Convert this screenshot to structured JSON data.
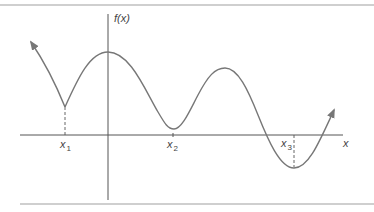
{
  "figure": {
    "y_axis_label": "f(x)",
    "x_axis_label": "x",
    "points": [
      {
        "base": "x",
        "sub": "1"
      },
      {
        "base": "x",
        "sub": "2"
      },
      {
        "base": "x",
        "sub": "3"
      }
    ]
  },
  "colors": {
    "curve": "#777777",
    "axis": "#555555",
    "rule": "#9a9a9a",
    "label": "#444444",
    "background": "#ffffff"
  }
}
